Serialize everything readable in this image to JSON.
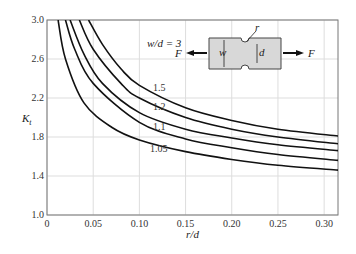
{
  "chart_data": {
    "type": "line",
    "title": "",
    "xlabel": "r/d",
    "ylabel": "K_t",
    "xlim": [
      0,
      0.315
    ],
    "ylim": [
      1.0,
      3.0
    ],
    "x_ticks": [
      "0",
      "0.05",
      "0.10",
      "0.15",
      "0.20",
      "0.25",
      "0.30"
    ],
    "y_ticks": [
      "1.0",
      "1.4",
      "1.8",
      "2.2",
      "2.6",
      "3.0"
    ],
    "grid": true,
    "series": [
      {
        "name": "w/d = 3",
        "x": [
          0.045,
          0.06,
          0.08,
          0.1,
          0.15,
          0.2,
          0.25,
          0.315
        ],
        "y": [
          3.0,
          2.75,
          2.5,
          2.33,
          2.1,
          1.97,
          1.88,
          1.81
        ]
      },
      {
        "name": "w/d = 1.5",
        "x": [
          0.035,
          0.05,
          0.08,
          0.1,
          0.15,
          0.2,
          0.25,
          0.315
        ],
        "y": [
          3.0,
          2.7,
          2.35,
          2.2,
          2.0,
          1.88,
          1.8,
          1.73
        ]
      },
      {
        "name": "w/d = 1.2",
        "x": [
          0.025,
          0.04,
          0.06,
          0.1,
          0.15,
          0.2,
          0.25,
          0.315
        ],
        "y": [
          3.0,
          2.65,
          2.35,
          2.05,
          1.88,
          1.79,
          1.72,
          1.66
        ]
      },
      {
        "name": "w/d = 1.1",
        "x": [
          0.02,
          0.03,
          0.05,
          0.1,
          0.15,
          0.2,
          0.25,
          0.315
        ],
        "y": [
          3.0,
          2.7,
          2.35,
          1.95,
          1.78,
          1.69,
          1.62,
          1.56
        ]
      },
      {
        "name": "w/d = 1.05",
        "x": [
          0.012,
          0.02,
          0.04,
          0.07,
          0.1,
          0.15,
          0.2,
          0.25,
          0.315
        ],
        "y": [
          3.0,
          2.6,
          2.15,
          1.9,
          1.77,
          1.65,
          1.57,
          1.51,
          1.46
        ]
      }
    ],
    "annotations": [
      "w/d = 3",
      "1.5",
      "1.2",
      "1.1",
      "1.05"
    ],
    "inset": {
      "labels": [
        "F",
        "F",
        "w",
        "d",
        "r"
      ],
      "description": "notched flat bar in tension"
    }
  }
}
